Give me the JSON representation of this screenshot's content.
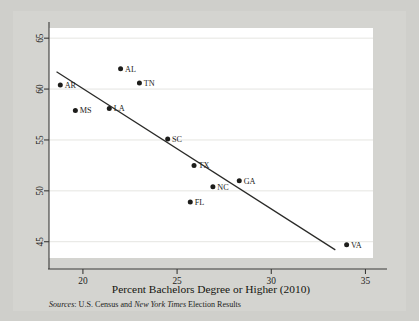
{
  "figure": {
    "background_color": "#d4d4d0",
    "page_background_color": "#cfcfcb",
    "plot_background_color": "#ffffff"
  },
  "source_note": {
    "prefix_italic": "Sources",
    "colon": ": ",
    "part1": "U.S. Census and ",
    "italic_name": "New York Times",
    "part2": " Election Results",
    "full": "Sources: U.S. Census and New York Times Election Results"
  },
  "chart_data": {
    "type": "scatter",
    "title": "",
    "xlabel": "Percent Bachelors Degree or Higher (2010)",
    "ylabel": "",
    "xlim": [
      18.2,
      35.4
    ],
    "ylim": [
      43.4,
      66.0
    ],
    "xticks": [
      20,
      25,
      30,
      35
    ],
    "xticklabels": [
      "20",
      "25",
      "30",
      "35"
    ],
    "yticks": [
      45,
      50,
      55,
      60,
      65
    ],
    "yticklabels": [
      "45",
      "50",
      "55",
      "60",
      "65"
    ],
    "grid": true,
    "grid_axis": "y",
    "legend": false,
    "point_label_position": "right",
    "points": [
      {
        "label": "AR",
        "x": 18.8,
        "y": 60.4
      },
      {
        "label": "MS",
        "x": 19.6,
        "y": 57.9
      },
      {
        "label": "LA",
        "x": 21.4,
        "y": 58.1
      },
      {
        "label": "AL",
        "x": 22.0,
        "y": 62.0
      },
      {
        "label": "TN",
        "x": 23.0,
        "y": 60.6
      },
      {
        "label": "SC",
        "x": 24.5,
        "y": 55.1
      },
      {
        "label": "FL",
        "x": 25.7,
        "y": 48.9
      },
      {
        "label": "TX",
        "x": 25.9,
        "y": 52.5
      },
      {
        "label": "NC",
        "x": 26.9,
        "y": 50.4
      },
      {
        "label": "GA",
        "x": 28.3,
        "y": 51.0
      },
      {
        "label": "VA",
        "x": 34.0,
        "y": 44.7
      }
    ],
    "fit_line": {
      "name": "linear-fit",
      "x0": 18.6,
      "y0": 61.7,
      "x1": 33.4,
      "y1": 44.2
    }
  }
}
